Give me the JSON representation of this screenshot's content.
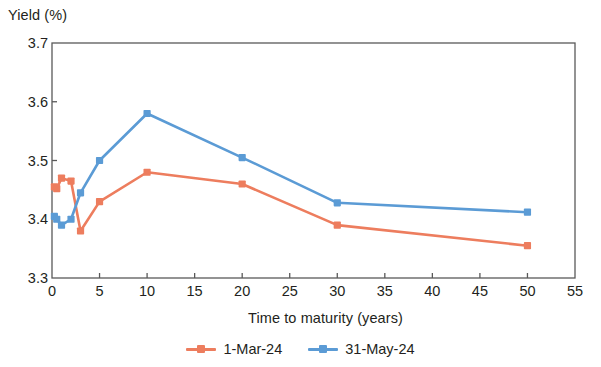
{
  "chart_data": {
    "type": "line",
    "title": "",
    "xlabel": "Time to maturity (years)",
    "ylabel": "Yield (%)",
    "xlim": [
      0,
      55
    ],
    "ylim": [
      3.3,
      3.7
    ],
    "xticks": [
      "0",
      "5",
      "10",
      "15",
      "20",
      "25",
      "30",
      "35",
      "40",
      "45",
      "50",
      "55"
    ],
    "xtick_values": [
      0,
      5,
      10,
      15,
      20,
      25,
      30,
      35,
      40,
      45,
      50,
      55
    ],
    "yticks": [
      "3.3",
      "3.4",
      "3.5",
      "3.6",
      "3.7"
    ],
    "ytick_values": [
      3.3,
      3.4,
      3.5,
      3.6,
      3.7
    ],
    "grid": false,
    "legend_position": "bottom",
    "markers": "square",
    "series": [
      {
        "name": "1-Mar-24",
        "color": "#ED7D5E",
        "x": [
          0.25,
          0.5,
          1,
          2,
          3,
          5,
          10,
          20,
          30,
          50
        ],
        "values": [
          3.455,
          3.452,
          3.47,
          3.465,
          3.38,
          3.43,
          3.48,
          3.46,
          3.39,
          3.355
        ]
      },
      {
        "name": "31-May-24",
        "color": "#5B9BD5",
        "x": [
          0.25,
          0.5,
          1,
          2,
          3,
          5,
          10,
          20,
          30,
          50
        ],
        "values": [
          3.405,
          3.4,
          3.39,
          3.4,
          3.445,
          3.5,
          3.58,
          3.505,
          3.428,
          3.412
        ]
      }
    ]
  },
  "axis": {
    "plot_left": 52,
    "plot_right": 575,
    "plot_top": 43,
    "plot_bottom": 278
  }
}
